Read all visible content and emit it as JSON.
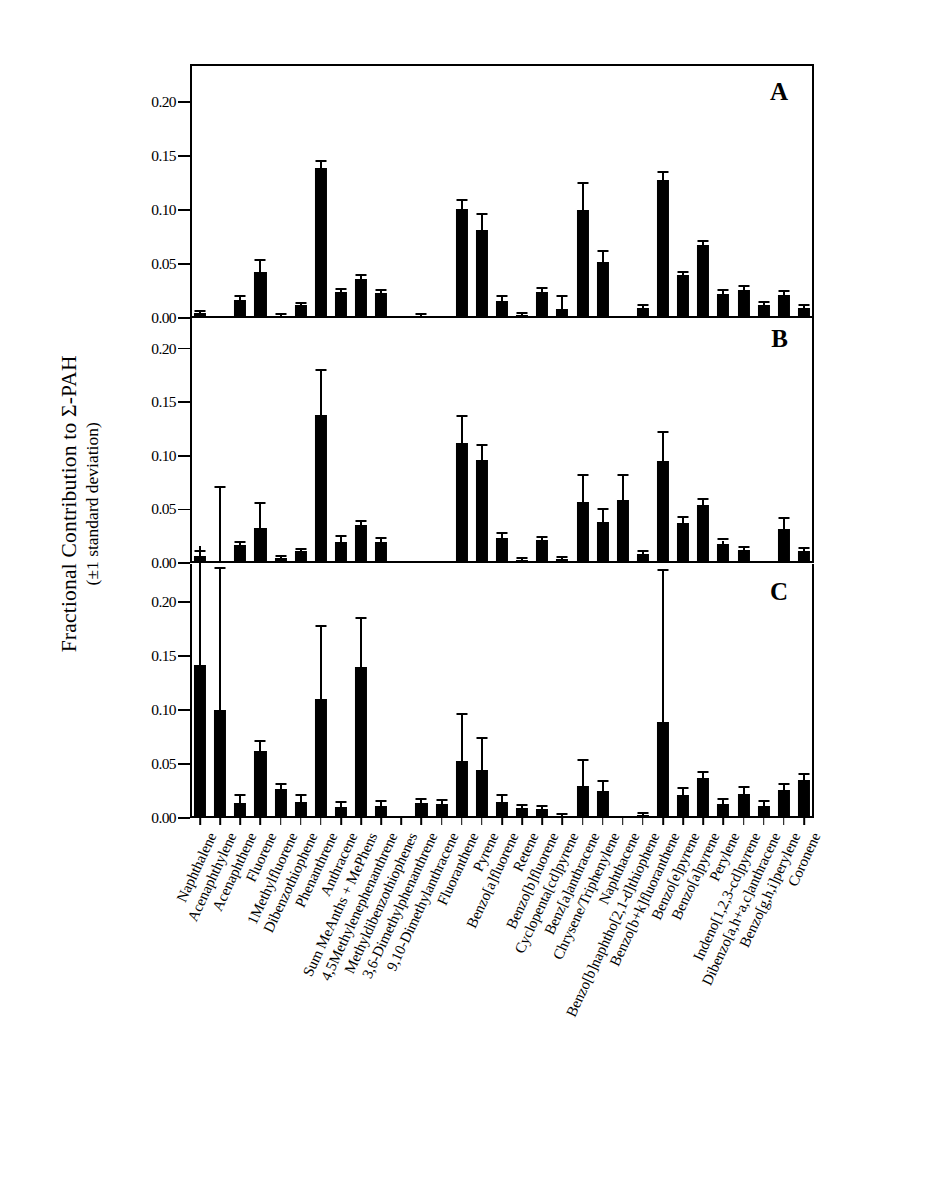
{
  "figure": {
    "ylabel_line1": "Fractional Contribution to Σ-PAH",
    "ylabel_line2": "(±1 standard deviation)",
    "panel_letters": [
      "A",
      "B",
      "C"
    ]
  },
  "chart_data": {
    "type": "bar",
    "title": "",
    "xlabel": "",
    "ylabel": "Fractional Contribution to Σ-PAH (±1 standard deviation)",
    "ylim": [
      0.0,
      0.235
    ],
    "yticks": [
      0.0,
      0.05,
      0.1,
      0.15,
      0.2
    ],
    "ytick_labels": [
      "0.00",
      "0.05",
      "0.10",
      "0.15",
      "0.20"
    ],
    "grid": false,
    "legend": "none",
    "error_bars": "±1 standard deviation",
    "panels": [
      "A",
      "B",
      "C"
    ],
    "categories": [
      "Naphthalene",
      "Acenaphthylene",
      "Acenaphthene",
      "Fluorene",
      "1Methylfluorene",
      "Dibenzothiophene",
      "Phenanthrene",
      "Anthracene",
      "Sum MeAnths + MePhens",
      "4,5Methylenephenanthrene",
      "Methyldibenzothiophenes",
      "3,6-Dimethylphenanthrene",
      "9,10-Dimethylanthracene",
      "Fluoranthene",
      "Pyrene",
      "Benzo[a]fluorene",
      "Retene",
      "Benzo[b]fluorene",
      "Cyclopenta[cd]pyrene",
      "Benz[a]anthracene",
      "Chrysene/Triphenylene",
      "Naphthacene",
      "Benzo[b]naphtho[2,1-d]thiophene",
      "Benzo[b+k]fluoranthene",
      "Benzo[e]pyrene",
      "Benzo[a]pyrene",
      "Perylene",
      "Indeno[1,2,3-cd]pyrene",
      "Dibenzo[a,h+a,c]anthracene",
      "Benzo[g,h,i]perylene",
      "Coronene"
    ],
    "series": [
      {
        "name": "A",
        "values": [
          0.005,
          0.0,
          0.017,
          0.043,
          0.002,
          0.012,
          0.139,
          0.024,
          0.036,
          0.023,
          0.0,
          0.002,
          0.0,
          0.101,
          0.081,
          0.016,
          0.003,
          0.024,
          0.008,
          0.1,
          0.052,
          0.0,
          0.009,
          0.128,
          0.04,
          0.068,
          0.022,
          0.026,
          0.012,
          0.021,
          0.009
        ],
        "errors": [
          0.001,
          0.0,
          0.002,
          0.01,
          0.001,
          0.001,
          0.005,
          0.002,
          0.003,
          0.002,
          0.0,
          0.001,
          0.0,
          0.007,
          0.014,
          0.003,
          0.001,
          0.003,
          0.011,
          0.024,
          0.009,
          0.0,
          0.002,
          0.006,
          0.002,
          0.002,
          0.003,
          0.003,
          0.002,
          0.003,
          0.002
        ]
      },
      {
        "name": "B",
        "values": [
          0.007,
          0.0,
          0.017,
          0.033,
          0.005,
          0.011,
          0.138,
          0.02,
          0.035,
          0.02,
          0.001,
          0.001,
          0.0,
          0.112,
          0.096,
          0.023,
          0.003,
          0.021,
          0.004,
          0.057,
          0.038,
          0.059,
          0.008,
          0.095,
          0.037,
          0.054,
          0.018,
          0.012,
          0.0,
          0.032,
          0.011
        ],
        "errors": [
          0.003,
          0.07,
          0.002,
          0.022,
          0.001,
          0.001,
          0.041,
          0.004,
          0.003,
          0.002,
          0.0,
          0.0,
          0.0,
          0.024,
          0.013,
          0.004,
          0.001,
          0.002,
          0.001,
          0.024,
          0.011,
          0.022,
          0.002,
          0.026,
          0.005,
          0.005,
          0.003,
          0.002,
          0.0,
          0.009,
          0.002
        ]
      },
      {
        "name": "C",
        "values": [
          0.142,
          0.1,
          0.014,
          0.062,
          0.027,
          0.015,
          0.11,
          0.01,
          0.14,
          0.011,
          0.0,
          0.014,
          0.013,
          0.053,
          0.044,
          0.015,
          0.009,
          0.008,
          0.002,
          0.03,
          0.025,
          0.0,
          0.003,
          0.089,
          0.021,
          0.037,
          0.013,
          0.022,
          0.011,
          0.026,
          0.035
        ],
        "errors": [
          0.11,
          0.13,
          0.006,
          0.008,
          0.004,
          0.005,
          0.067,
          0.004,
          0.044,
          0.004,
          0.0,
          0.003,
          0.003,
          0.042,
          0.029,
          0.005,
          0.002,
          0.002,
          0.001,
          0.023,
          0.008,
          0.0,
          0.001,
          0.14,
          0.006,
          0.005,
          0.004,
          0.006,
          0.004,
          0.005,
          0.005
        ]
      }
    ]
  }
}
